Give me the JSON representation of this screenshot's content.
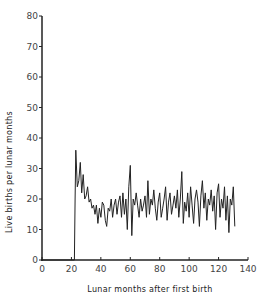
{
  "chart_data": {
    "type": "line",
    "title": "",
    "xlabel": "Lunar months after first birth",
    "ylabel": "Live births per lunar months",
    "xlim": [
      0,
      140
    ],
    "ylim": [
      0,
      80
    ],
    "xticks": [
      0,
      20,
      40,
      60,
      80,
      100,
      120,
      140
    ],
    "yticks": [
      0,
      10,
      20,
      30,
      40,
      50,
      60,
      70,
      80
    ],
    "grid": false,
    "legend": null,
    "series": [
      {
        "name": "Live births",
        "color": "#222222",
        "x": [
          0,
          22,
          22.5,
          23,
          24,
          25,
          26,
          27,
          28,
          29,
          30,
          31,
          32,
          33,
          34,
          35,
          36,
          37,
          38,
          39,
          40,
          41,
          42,
          43,
          44,
          45,
          46,
          47,
          48,
          49,
          50,
          51,
          52,
          53,
          54,
          55,
          56,
          57,
          58,
          59,
          60,
          61,
          62,
          63,
          64,
          65,
          66,
          67,
          68,
          69,
          70,
          71,
          72,
          73,
          74,
          75,
          76,
          77,
          78,
          79,
          80,
          81,
          82,
          83,
          84,
          85,
          86,
          87,
          88,
          89,
          90,
          91,
          92,
          93,
          94,
          95,
          96,
          97,
          98,
          99,
          100,
          101,
          102,
          103,
          104,
          105,
          106,
          107,
          108,
          109,
          110,
          111,
          112,
          113,
          114,
          115,
          116,
          117,
          118,
          119,
          120,
          121,
          122,
          123,
          124,
          125,
          126,
          127,
          128,
          129,
          130,
          131
        ],
        "values": [
          0,
          0,
          20,
          36,
          24,
          26,
          32,
          22,
          28,
          20,
          21,
          24,
          19,
          20,
          17,
          18,
          15,
          18,
          12,
          17,
          14,
          19,
          18,
          13,
          11,
          17,
          16,
          20,
          14,
          18,
          20,
          15,
          19,
          21,
          14,
          22,
          15,
          20,
          10,
          24,
          31,
          8,
          20,
          18,
          22,
          18,
          14,
          20,
          16,
          18,
          21,
          14,
          26,
          15,
          20,
          18,
          23,
          17,
          13,
          19,
          22,
          14,
          17,
          20,
          24,
          13,
          19,
          22,
          15,
          18,
          21,
          17,
          23,
          14,
          20,
          29,
          12,
          19,
          16,
          22,
          14,
          24,
          18,
          12,
          20,
          23,
          19,
          11,
          21,
          26,
          17,
          22,
          13,
          20,
          18,
          23,
          16,
          21,
          10,
          22,
          25,
          14,
          20,
          17,
          24,
          13,
          21,
          9,
          20,
          18,
          24,
          11
        ]
      }
    ],
    "annotations": []
  }
}
